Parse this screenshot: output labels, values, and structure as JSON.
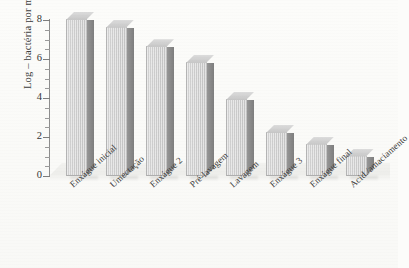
{
  "chart_data": {
    "type": "bar",
    "title": "",
    "xlabel": "",
    "ylabel": "Log – bactéria por ml",
    "ylim": [
      0,
      8
    ],
    "ytick_labels": [
      "0",
      "2",
      "4",
      "6",
      "8"
    ],
    "ytick_values": [
      0,
      2,
      4,
      6,
      8
    ],
    "minor_ticks": true,
    "grid": false,
    "legend": "none",
    "style_3d": true,
    "categories": [
      "Enxágue inicial",
      "Umectação",
      "Enxágue 2",
      "Pré-lavagem",
      "Lavagem",
      "Enxágue 3",
      "Enxágue final",
      "Acid./amaciamento"
    ],
    "values": [
      8.0,
      7.6,
      6.6,
      5.8,
      3.9,
      2.2,
      1.6,
      1.0
    ],
    "bar_colors": {
      "front": "#cbcbcb",
      "side": "#868686",
      "top": "#d2d2d2"
    },
    "background": "#fcfcfa"
  }
}
